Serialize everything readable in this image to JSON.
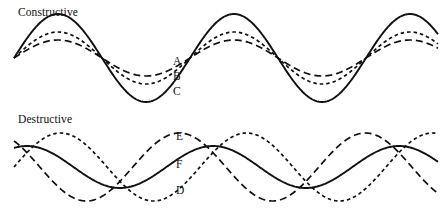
{
  "figure": {
    "width": 441,
    "height": 216,
    "background_color": "#ffffff",
    "stroke_color": "#111111"
  },
  "panels": [
    {
      "id": "constructive",
      "title": "Constructive",
      "title_position": {
        "x": 18,
        "y": 6
      }
    },
    {
      "id": "destructive",
      "title": "Destructive",
      "title_position": {
        "x": 18,
        "y": 113
      }
    }
  ],
  "labels": {
    "A": "A",
    "B": "B",
    "C": "C",
    "D": "D",
    "E": "E",
    "F": "F"
  },
  "chart_data": {
    "type": "line",
    "xlabel": "",
    "ylabel": "",
    "grid": false,
    "legend_position": "inline-curve-labels",
    "axis_hidden": true,
    "panels": [
      {
        "name": "Constructive",
        "description": "Two in-phase sine waves A and B sum to a larger resultant C.",
        "baseline_y": 58,
        "x_range": [
          14,
          438
        ],
        "wavelength": 176,
        "node_x_positions": [
          43,
          135,
          219,
          307,
          395
        ],
        "series": [
          {
            "name": "A",
            "label": "A",
            "line_style": "long-dash",
            "dash_pattern": "7,4",
            "amplitude": 18,
            "phase_deg": 0,
            "stroke_width": 1.7,
            "role": "component-wave"
          },
          {
            "name": "B",
            "label": "B",
            "line_style": "short-dash",
            "dash_pattern": "3.5,3",
            "amplitude": 26,
            "phase_deg": 0,
            "stroke_width": 1.7,
            "role": "component-wave"
          },
          {
            "name": "C",
            "label": "C",
            "line_style": "solid",
            "dash_pattern": "none",
            "amplitude": 44,
            "phase_deg": 0,
            "stroke_width": 1.9,
            "role": "resultant-wave"
          }
        ]
      },
      {
        "name": "Destructive",
        "description": "Two out-of-phase sine waves D and E partially cancel, giving the smaller resultant F.",
        "baseline_y": 167,
        "x_range": [
          14,
          438
        ],
        "wavelength": 186,
        "node_x_positions": [
          128,
          219,
          313,
          408
        ],
        "series": [
          {
            "name": "D",
            "label": "D",
            "line_style": "short-dash",
            "dash_pattern": "3.5,3",
            "amplitude": 34,
            "phase_deg": 0,
            "stroke_width": 1.7,
            "role": "component-wave"
          },
          {
            "name": "E",
            "label": "E",
            "line_style": "long-dash",
            "dash_pattern": "7,4",
            "amplitude": 34,
            "phase_deg": 130,
            "stroke_width": 1.7,
            "role": "component-wave"
          },
          {
            "name": "F",
            "label": "F",
            "line_style": "solid",
            "dash_pattern": "none",
            "amplitude": 21,
            "phase_deg": 65,
            "stroke_width": 1.9,
            "role": "resultant-wave"
          }
        ]
      }
    ]
  }
}
